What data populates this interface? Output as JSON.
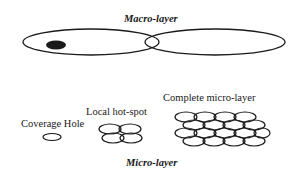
{
  "diagram": {
    "macro_label": "Macro-layer",
    "micro_label": "Micro-layer",
    "coverage_hole_label": "Coverage Hole",
    "local_hotspot_label": "Local hot-spot",
    "complete_micro_label": "Complete micro-layer",
    "colors": {
      "stroke": "#1a1a1a",
      "fill_dark": "#1a1a1a",
      "background": "#ffffff"
    }
  }
}
